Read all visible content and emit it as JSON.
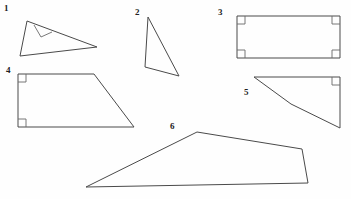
{
  "page": {
    "background_color": "#fefefe",
    "stroke_color": "#4a4a4a",
    "angle_mark_color": "#6a6a6a",
    "label_color": "#222222",
    "width": 351,
    "height": 199
  },
  "figures": [
    {
      "label": "1",
      "name": "right-triangle",
      "label_position": {
        "x": 4,
        "y": 4
      },
      "outline": "M 27,21 L 97,47 L 20,56 Z",
      "right_angle_marks": [
        "M 34,25 L 41,37 L 52,32"
      ],
      "vertices": [
        [
          27,
          21
        ],
        [
          97,
          47
        ],
        [
          20,
          56
        ]
      ],
      "right_angle_count": 1
    },
    {
      "label": "2",
      "name": "scalene-triangle",
      "label_position": {
        "x": 135,
        "y": 8
      },
      "outline": "M 148,17 L 179,76 L 145,67 Z",
      "right_angle_marks": [],
      "vertices": [
        [
          148,
          17
        ],
        [
          179,
          76
        ],
        [
          145,
          67
        ]
      ],
      "right_angle_count": 0
    },
    {
      "label": "3",
      "name": "rectangle",
      "label_position": {
        "x": 218,
        "y": 8
      },
      "outline": "M 237,16 L 340,16 L 340,58 L 237,58 Z",
      "right_angle_marks": [
        "M 237,24 L 245,24 L 245,16",
        "M 332,16 L 332,24 L 340,24",
        "M 237,50 L 245,50 L 245,58",
        "M 332,58 L 332,50 L 340,50"
      ],
      "vertices": [
        [
          237,
          16
        ],
        [
          340,
          16
        ],
        [
          340,
          58
        ],
        [
          237,
          58
        ]
      ],
      "right_angle_count": 4
    },
    {
      "label": "4",
      "name": "right-trapezoid",
      "label_position": {
        "x": 6,
        "y": 66
      },
      "outline": "M 18,74 L 94,74 L 134,127 L 18,127 Z",
      "right_angle_marks": [
        "M 18,82 L 26,82 L 26,74",
        "M 18,119 L 26,119 L 26,127"
      ],
      "vertices": [
        [
          18,
          74
        ],
        [
          94,
          74
        ],
        [
          134,
          127
        ],
        [
          18,
          127
        ]
      ],
      "right_angle_count": 2
    },
    {
      "label": "5",
      "name": "concave-quadrilateral",
      "label_position": {
        "x": 244,
        "y": 88
      },
      "outline": "M 254,77 L 340,77 L 340,128 L 291,104 Z",
      "right_angle_marks": [
        "M 332,77 L 332,85 L 340,85"
      ],
      "vertices": [
        [
          254,
          77
        ],
        [
          340,
          77
        ],
        [
          340,
          128
        ],
        [
          291,
          104
        ]
      ],
      "right_angle_count": 1
    },
    {
      "label": "6",
      "name": "irregular-pentagon",
      "label_position": {
        "x": 170,
        "y": 122
      },
      "outline": "M 197,132 L 302,149 L 308,183 L 86,187 Z",
      "right_angle_marks": [],
      "vertices": [
        [
          197,
          132
        ],
        [
          302,
          149
        ],
        [
          308,
          183
        ],
        [
          86,
          187
        ]
      ],
      "right_angle_count": 0
    }
  ]
}
